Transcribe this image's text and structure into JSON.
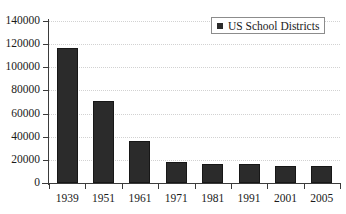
{
  "chart_data": {
    "type": "bar",
    "title": "",
    "subtitle": "",
    "xlabel": "",
    "ylabel": "",
    "categories": [
      "1939",
      "1951",
      "1961",
      "1971",
      "1981",
      "1991",
      "2001",
      "2005"
    ],
    "values": [
      117000,
      71000,
      36000,
      18500,
      16500,
      16000,
      15000,
      14500
    ],
    "series": [
      {
        "name": "US School Districts",
        "values": [
          117000,
          71000,
          36000,
          18500,
          16500,
          16000,
          15000,
          14500
        ],
        "color": "#2b2b2b"
      }
    ],
    "ylim": [
      0,
      140000
    ],
    "ytick_values": [
      0,
      20000,
      40000,
      60000,
      80000,
      100000,
      120000,
      140000
    ],
    "ytick_labels": [
      "0",
      "20000",
      "40000",
      "60000",
      "80000",
      "100000",
      "120000",
      "140000"
    ],
    "grid": true,
    "grid_axis": "y",
    "grid_style": "dotted",
    "legend_position": "top-right",
    "legend_entries": [
      "US School Districts"
    ],
    "annotations": []
  },
  "legend": {
    "label": "US School Districts",
    "swatch_name": "legend-swatch-us-school-districts"
  },
  "colors": {
    "bar": "#2b2b2b",
    "axis": "#3b3b3b",
    "grid": "#d2d2d2",
    "legend_border": "#8c8c8c",
    "background": "#ffffff",
    "text": "#1a1a1a"
  }
}
